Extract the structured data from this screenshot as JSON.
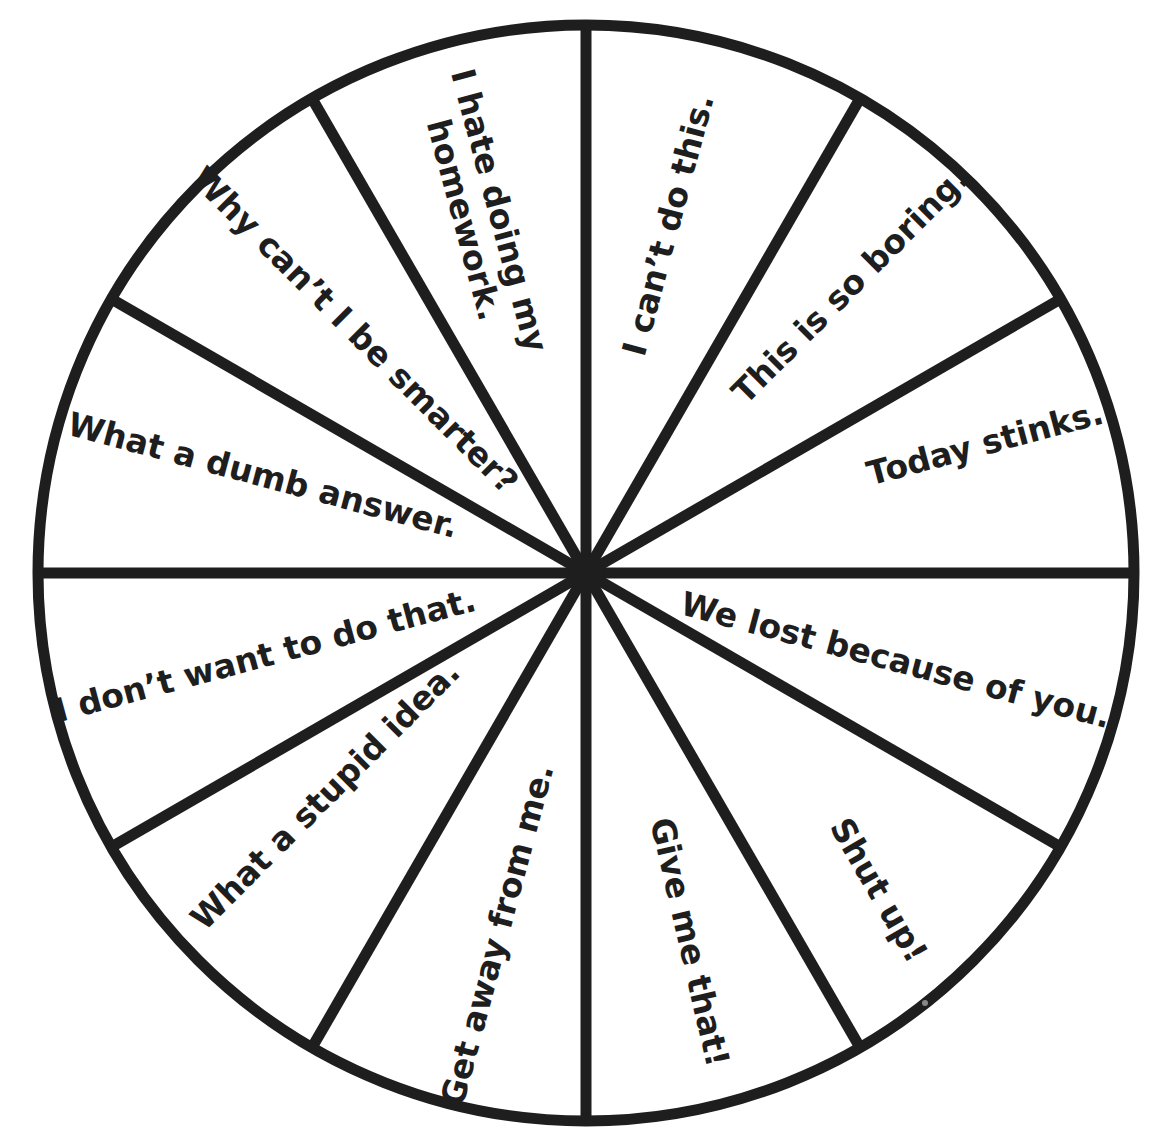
{
  "wheel": {
    "center": {
      "x": 586,
      "y": 573
    },
    "radius": 548,
    "stroke_color": "#1e1e1e",
    "background": "#ffffff",
    "segment_count": 12,
    "spoke_angles_deg": [
      0,
      30,
      60,
      90,
      120,
      150,
      180,
      210,
      240,
      270,
      300,
      330
    ],
    "segments": [
      {
        "id": "seg-1",
        "text": [
          "I can’t do this."
        ],
        "pos": {
          "x": 668,
          "y": 225
        },
        "rotate": -75,
        "size": 33
      },
      {
        "id": "seg-2",
        "text": [
          "This is so boring."
        ],
        "pos": {
          "x": 850,
          "y": 285
        },
        "rotate": -45,
        "size": 33
      },
      {
        "id": "seg-3",
        "text": [
          "Today stinks."
        ],
        "pos": {
          "x": 985,
          "y": 443
        },
        "rotate": -15,
        "size": 33
      },
      {
        "id": "seg-4",
        "text": [
          "We lost because of you."
        ],
        "pos": {
          "x": 896,
          "y": 660
        },
        "rotate": 15,
        "size": 33
      },
      {
        "id": "seg-5",
        "text": [
          "Shut up!"
        ],
        "pos": {
          "x": 879,
          "y": 890
        },
        "rotate": 60,
        "size": 33
      },
      {
        "id": "seg-6",
        "text": [
          "Give me that!"
        ],
        "pos": {
          "x": 690,
          "y": 942
        },
        "rotate": 77,
        "size": 33
      },
      {
        "id": "seg-7",
        "text": [
          "Get away from me."
        ],
        "pos": {
          "x": 497,
          "y": 935
        },
        "rotate": -75,
        "size": 33
      },
      {
        "id": "seg-8",
        "text": [
          "What a stupid idea."
        ],
        "pos": {
          "x": 325,
          "y": 795
        },
        "rotate": -45,
        "size": 33
      },
      {
        "id": "seg-9",
        "text": [
          "I don’t want to do that."
        ],
        "pos": {
          "x": 265,
          "y": 655
        },
        "rotate": -15,
        "size": 33
      },
      {
        "id": "seg-10",
        "text": [
          "What a dumb answer."
        ],
        "pos": {
          "x": 263,
          "y": 475
        },
        "rotate": 15,
        "size": 33
      },
      {
        "id": "seg-11",
        "text": [
          "Why can’t I be smarter?"
        ],
        "pos": {
          "x": 355,
          "y": 330
        },
        "rotate": 45,
        "size": 33
      },
      {
        "id": "seg-12",
        "text": [
          "I hate doing my",
          "homework."
        ],
        "pos": {
          "x": 482,
          "y": 215
        },
        "rotate": 75,
        "size": 33
      }
    ]
  }
}
